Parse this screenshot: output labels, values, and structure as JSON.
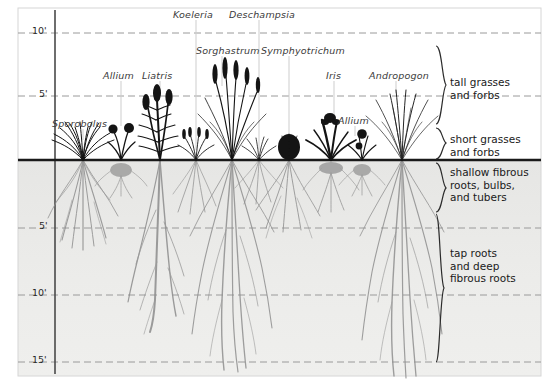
{
  "figure": {
    "colors": {
      "sky": "#ffffff",
      "soil": "#ececea",
      "soil_deep": "#e8e8e6",
      "ground_line": "#1a1a1a",
      "gridline": "#9a9a9a",
      "axis": "#4a4a4a",
      "foliage": "#1a1a1a",
      "root": "#8c8c8c",
      "label_text": "#3a3a3a",
      "zone_text": "#1a1a1a",
      "bracket": "#2b2b2b",
      "leader": "#c8c8c8",
      "frame": "#cfcfcf"
    },
    "ground_line_y": 160,
    "axis_x": 55
  },
  "axis": {
    "above_ground": [
      {
        "label": "10'",
        "y": 33
      },
      {
        "label": "5'",
        "y": 96
      }
    ],
    "below_ground": [
      {
        "label": "5'",
        "y": 228
      },
      {
        "label": "10'",
        "y": 295
      },
      {
        "label": "15'",
        "y": 362
      }
    ]
  },
  "species_labels": [
    {
      "name": "Koeleria",
      "x": 173,
      "y": 9,
      "leader_x": 196,
      "leader_y1": 20,
      "leader_y2": 152
    },
    {
      "name": "Deschampsia",
      "x": 229,
      "y": 9,
      "leader_x": 259,
      "leader_y1": 20,
      "leader_y2": 152
    },
    {
      "name": "Sorghastrum",
      "x": 196,
      "y": 45,
      "leader_x": 222,
      "leader_y1": 56,
      "leader_y2": 86
    },
    {
      "name": "Symphyotrichum",
      "x": 261,
      "y": 45,
      "leader_x": 289,
      "leader_y1": 56,
      "leader_y2": 142
    },
    {
      "name": "Allium",
      "x": 103,
      "y": 70,
      "leader_x": 121,
      "leader_y1": 81,
      "leader_y2": 126
    },
    {
      "name": "Liatris",
      "x": 142,
      "y": 70,
      "leader_x": 160,
      "leader_y1": 81,
      "leader_y2": 96
    },
    {
      "name": "Iris",
      "x": 326,
      "y": 70,
      "leader_x": 334,
      "leader_y1": 81,
      "leader_y2": 122
    },
    {
      "name": "Andropogon",
      "x": 369,
      "y": 70,
      "leader_x": 396,
      "leader_y1": 81,
      "leader_y2": 93
    },
    {
      "name": "Sporobolus",
      "x": 52,
      "y": 118,
      "leader_x": 83,
      "leader_y1": 129,
      "leader_y2": 142
    },
    {
      "name": "Allium",
      "x": 338,
      "y": 115,
      "leader_x": 355,
      "leader_y1": 126,
      "leader_y2": 137
    }
  ],
  "zones": [
    {
      "id": "tall-grasses",
      "lines": [
        "tall grasses",
        "and forbs"
      ],
      "text_x": 450,
      "text_y": 82,
      "bracket_x": 432,
      "bracket_top": 46,
      "bracket_bottom": 124
    },
    {
      "id": "short-grasses",
      "lines": [
        "short grasses",
        "and forbs"
      ],
      "text_x": 450,
      "text_y": 139,
      "bracket_x": 432,
      "bracket_top": 128,
      "bracket_bottom": 159
    },
    {
      "id": "shallow-fibrous",
      "lines": [
        "shallow fibrous",
        "roots, bulbs,",
        "and tubers"
      ],
      "text_x": 450,
      "text_y": 172,
      "bracket_x": 432,
      "bracket_top": 163,
      "bracket_bottom": 212
    },
    {
      "id": "tap-roots",
      "lines": [
        "tap roots",
        "and deep",
        "fibrous roots"
      ],
      "text_x": 450,
      "text_y": 253,
      "bracket_x": 432,
      "bracket_top": 214,
      "bracket_bottom": 362
    }
  ],
  "plants": [
    {
      "id": "sporobolus",
      "name": "Sporobolus",
      "base_x": 83,
      "top_y": 133,
      "root_depth_y": 252,
      "form": "bunch-grass",
      "root_form": "fibrous-shallow"
    },
    {
      "id": "allium-left",
      "name": "Allium",
      "base_x": 121,
      "top_y": 126,
      "root_depth_y": 196,
      "form": "bulb-umbel",
      "root_form": "bulb"
    },
    {
      "id": "liatris",
      "name": "Liatris",
      "base_x": 160,
      "top_y": 87,
      "root_depth_y": 330,
      "form": "spike-forb",
      "root_form": "tap-root"
    },
    {
      "id": "koeleria",
      "name": "Koeleria",
      "base_x": 196,
      "top_y": 138,
      "root_depth_y": 216,
      "form": "short-grass",
      "root_form": "fibrous-shallow"
    },
    {
      "id": "sorghastrum",
      "name": "Sorghastrum",
      "base_x": 232,
      "top_y": 60,
      "root_depth_y": 372,
      "form": "tall-grass",
      "root_form": "fibrous-deep"
    },
    {
      "id": "deschampsia",
      "name": "Deschampsia",
      "base_x": 259,
      "top_y": 135,
      "root_depth_y": 205,
      "form": "short-grass",
      "root_form": "fibrous-shallow"
    },
    {
      "id": "symphyotrichum",
      "name": "Symphyotrichum",
      "base_x": 289,
      "top_y": 134,
      "root_depth_y": 240,
      "form": "dense-forb",
      "root_form": "fibrous-shallow"
    },
    {
      "id": "iris",
      "name": "Iris",
      "base_x": 331,
      "top_y": 118,
      "root_depth_y": 215,
      "form": "iris-fan",
      "root_form": "rhizome"
    },
    {
      "id": "allium-right",
      "name": "Allium",
      "base_x": 362,
      "top_y": 128,
      "root_depth_y": 195,
      "form": "bulb-umbel",
      "root_form": "bulb"
    },
    {
      "id": "andropogon",
      "name": "Andropogon",
      "base_x": 402,
      "top_y": 88,
      "root_depth_y": 378,
      "form": "tall-grass",
      "root_form": "fibrous-deep"
    }
  ]
}
